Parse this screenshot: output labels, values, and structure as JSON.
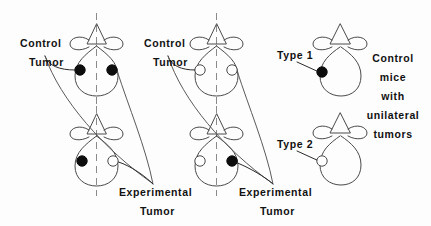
{
  "figure": {
    "background_color": "#fdfdfd",
    "ink_color": "#111111",
    "outline_color": "#4a4a4a",
    "midline_color": "#8a8a8a",
    "filled_marker_color": "#0d0d0d",
    "open_marker_fill": "#ffffff"
  },
  "groups": [
    {
      "name": "left-group",
      "top_mouse": {
        "name": "top-mouse-left-group",
        "markers": [
          {
            "side": "left",
            "type": "filled"
          },
          {
            "side": "right",
            "type": "filled"
          }
        ]
      },
      "bottom_mouse": {
        "name": "bottom-mouse-left-group",
        "markers": [
          {
            "side": "left",
            "type": "filled"
          },
          {
            "side": "right",
            "type": "open"
          }
        ]
      },
      "labels": {
        "control_line1": "Control",
        "control_line2": "Tumor",
        "experimental_line1": "Experimental",
        "experimental_line2": "Tumor"
      }
    },
    {
      "name": "middle-group",
      "top_mouse": {
        "name": "top-mouse-middle-group",
        "markers": [
          {
            "side": "left",
            "type": "open"
          },
          {
            "side": "right",
            "type": "open"
          }
        ]
      },
      "bottom_mouse": {
        "name": "bottom-mouse-middle-group",
        "markers": [
          {
            "side": "left",
            "type": "open"
          },
          {
            "side": "right",
            "type": "filled"
          }
        ]
      },
      "labels": {
        "control_line1": "Control",
        "control_line2": "Tumor",
        "experimental_line1": "Experimental",
        "experimental_line2": "Tumor"
      }
    }
  ],
  "legend": {
    "name": "legend-panel",
    "type1": {
      "label": "Type 1",
      "marker": "filled"
    },
    "type2": {
      "label": "Type 2",
      "marker": "open"
    },
    "caption_lines": [
      "Control",
      "mice",
      "with",
      "unilateral",
      "tumors"
    ]
  }
}
